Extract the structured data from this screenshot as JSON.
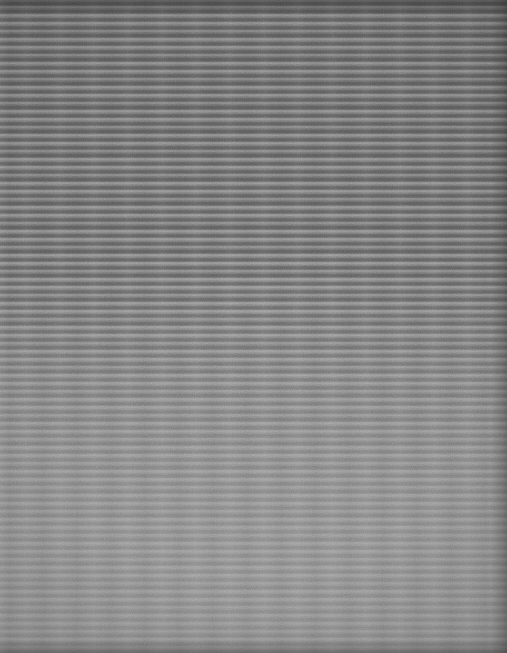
{
  "document": {
    "kind": "scanned-page",
    "legibility": "illegible",
    "page_width": 507,
    "page_height": 653,
    "description": "Heavily blurred / out-of-focus scan of a printed page. No glyph, caption, heading, page number or marginal mark is resolvable at any zoom level.",
    "visible_text": "",
    "body": {
      "layout": "single-column",
      "alignment": "justified",
      "line_spacing_px": 8,
      "line_count_estimate": 78,
      "margins": {
        "left_px": 4,
        "right_px": 8,
        "top_px": 2,
        "bottom_px": 6
      },
      "paragraph_breaks_visible": false,
      "headings_visible": false,
      "figures_visible": false,
      "page_number_visible": false
    },
    "regions": [
      {
        "name": "upper-dense-block",
        "y_start": 0,
        "y_end": 310,
        "ink_density": "high",
        "contrast": "high",
        "mean_tone": "#858585"
      },
      {
        "name": "mid-fading-block",
        "y_start": 310,
        "y_end": 470,
        "ink_density": "medium",
        "contrast": "medium",
        "mean_tone": "#969696"
      },
      {
        "name": "lower-faint-block",
        "y_start": 470,
        "y_end": 653,
        "ink_density": "low",
        "contrast": "low",
        "mean_tone": "#a1a1a1"
      }
    ],
    "edges": {
      "top_shadow": true,
      "bottom_shadow": true,
      "right_shadow": true,
      "left_highlight": true
    }
  },
  "palette": {
    "paper_dark": "#828282",
    "paper_mid": "#909090",
    "paper_light": "#a2a2a2",
    "ink": "#3c3c3c",
    "line_highlight": "#c6c6c6",
    "edge_shadow": "#2a2a2a"
  }
}
